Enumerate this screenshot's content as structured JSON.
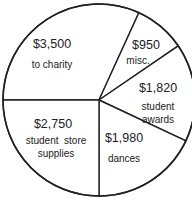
{
  "chart_data": {
    "type": "pie",
    "title": "",
    "start_angle_deg": 180,
    "direction": "clockwise",
    "center": [
      99,
      100
    ],
    "radius": 96,
    "stroke_color": "#222222",
    "fill_color": "#ffffff",
    "slices": [
      {
        "label": "to charity",
        "amount_label": "$3,500",
        "value": 3500,
        "desc_lines": [
          "to charity"
        ],
        "amt_pos": [
          52,
          48
        ],
        "desc_pos": [
          52,
          68
        ]
      },
      {
        "label": "misc.",
        "amount_label": "$950",
        "value": 950,
        "desc_lines": [
          "misc."
        ],
        "amt_pos": [
          146,
          49
        ],
        "desc_pos": [
          138,
          64
        ]
      },
      {
        "label": "student awards",
        "amount_label": "$1,820",
        "value": 1820,
        "desc_lines": [
          "student",
          "awards"
        ],
        "amt_pos": [
          158,
          92
        ],
        "desc_pos": [
          158,
          110
        ]
      },
      {
        "label": "dances",
        "amount_label": "$1,980",
        "value": 1980,
        "desc_lines": [
          "dances"
        ],
        "amt_pos": [
          124,
          142
        ],
        "desc_pos": [
          124,
          162
        ]
      },
      {
        "label": "student store supplies",
        "amount_label": "$2,750",
        "value": 2750,
        "desc_lines": [
          "student  store",
          "supplies"
        ],
        "amt_pos": [
          53,
          128
        ],
        "desc_pos": [
          56,
          144
        ]
      }
    ],
    "total": 11000,
    "legend": null
  }
}
